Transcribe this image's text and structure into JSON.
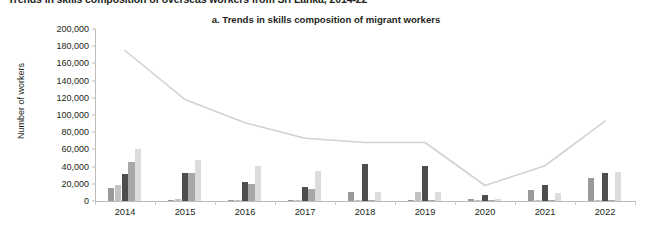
{
  "report_title": "Trends in skills composition of overseas workers from Sri Lanka, 2014-22",
  "panel_caption": "a. Trends in skills composition of migrant workers",
  "chart_data": {
    "type": "bar",
    "title": "a. Trends in skills composition of migrant workers",
    "xlabel": "",
    "ylabel": "Number of workers",
    "categories": [
      "2014",
      "2015",
      "2016",
      "2017",
      "2018",
      "2019",
      "2020",
      "2021",
      "2022"
    ],
    "ylim": [
      0,
      200000
    ],
    "ytick_values": [
      0,
      20000,
      40000,
      60000,
      80000,
      100000,
      120000,
      140000,
      160000,
      180000,
      200000
    ],
    "ytick_labels": [
      "0",
      "20,000",
      "40,000",
      "60,000",
      "80,000",
      "100,000",
      "120,000",
      "140,000",
      "160,000",
      "180,000",
      "200,000"
    ],
    "grid": false,
    "legend": "none",
    "series": [
      {
        "name": "series-1",
        "color": "#9a9a9a",
        "values": [
          15000,
          1500,
          1000,
          600,
          11000,
          700,
          2500,
          13000,
          27000
        ]
      },
      {
        "name": "series-2",
        "color": "#c2c2c2",
        "values": [
          19000,
          2000,
          1200,
          700,
          1500,
          10500,
          1000,
          1000,
          1500
        ]
      },
      {
        "name": "series-3",
        "color": "#4d4d4d",
        "values": [
          31000,
          32000,
          22000,
          16000,
          43000,
          41000,
          6500,
          19000,
          33000
        ]
      },
      {
        "name": "series-4",
        "color": "#a8a8a8",
        "values": [
          45000,
          33000,
          20000,
          14000,
          1500,
          1200,
          1000,
          1000,
          1000
        ]
      },
      {
        "name": "series-5",
        "color": "#dcdcdc",
        "values": [
          60000,
          48000,
          41000,
          35000,
          10000,
          11000,
          2500,
          9000,
          34000
        ]
      }
    ],
    "line_series": {
      "name": "total-departures-line",
      "color": "#d2d2d2",
      "values": [
        175000,
        118000,
        91000,
        73000,
        68000,
        68000,
        18000,
        41000,
        93000
      ]
    }
  }
}
